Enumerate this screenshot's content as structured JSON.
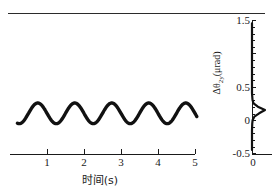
{
  "figure": {
    "has_top_rule": true,
    "background_color": "#ffffff",
    "line_color": "#1a1a1a"
  },
  "chart_data": [
    {
      "type": "line",
      "title": "",
      "subtitle": "",
      "xlabel": "时间(s)",
      "ylabel": "",
      "xlim": [
        0.2,
        5.1
      ],
      "ylim": [
        -0.5,
        1.5
      ],
      "xticks": [
        1,
        2,
        3,
        4,
        5
      ],
      "xticklabels": [
        "1",
        "2",
        "3",
        "4",
        "5"
      ],
      "grid": false,
      "legend": "none",
      "series": [
        {
          "name": "Δθ 2y oscillation",
          "waveform": "sine",
          "frequency_hz": 1.0,
          "amplitude": 0.155,
          "offset": 0.1,
          "phase_deg": 180,
          "x_start": 0.2,
          "x_end": 5.05,
          "color": "#111111",
          "linewidth": 3.0,
          "x": [
            0.2,
            0.3,
            0.4,
            0.5,
            0.6,
            0.7,
            0.8,
            0.9,
            1.0,
            1.1,
            1.2,
            1.3,
            1.4,
            1.5,
            1.6,
            1.7,
            1.8,
            1.9,
            2.0,
            2.1,
            2.2,
            2.3,
            2.4,
            2.5,
            2.6,
            2.7,
            2.8,
            2.9,
            3.0,
            3.1,
            3.2,
            3.3,
            3.4,
            3.5,
            3.6,
            3.7,
            3.8,
            3.9,
            4.0,
            4.1,
            4.2,
            4.3,
            4.4,
            4.5,
            4.6,
            4.7,
            4.8,
            4.9,
            5.0
          ],
          "y": [
            0.191,
            0.126,
            0.048,
            -0.006,
            -0.026,
            -0.006,
            0.048,
            0.126,
            0.21,
            0.28,
            0.252,
            0.198,
            0.048,
            -0.006,
            -0.026,
            -0.006,
            0.048,
            0.126,
            0.21,
            0.28,
            0.252,
            0.198,
            0.048,
            -0.006,
            -0.026,
            -0.006,
            0.048,
            0.126,
            0.21,
            0.28,
            0.252,
            0.198,
            0.048,
            -0.006,
            -0.026,
            -0.006,
            0.048,
            0.126,
            0.21,
            0.28,
            0.252,
            0.198,
            0.048,
            -0.006,
            -0.026,
            -0.006,
            0.048,
            0.126,
            0.21
          ]
        }
      ]
    },
    {
      "type": "line",
      "title": "",
      "xlabel": "0",
      "ylabel": "Δθ",
      "ylabel_sub": "2y",
      "ylabel_unit": "(μrad)",
      "ylabel_full": "Δθ₂ᵧ(μrad)",
      "ylim": [
        -0.5,
        1.5
      ],
      "yticks": [
        -0.5,
        0,
        0.5,
        1.0,
        1.5
      ],
      "yticklabels": [
        "-0.5",
        "0",
        "0.5",
        "",
        "1.5"
      ],
      "grid": false,
      "legend": "none",
      "description": "marginal distribution of Δθ 2y, narrow peak near 0.15 μrad",
      "series": [
        {
          "name": "distribution",
          "color": "#111111",
          "linewidth": 2.0,
          "peak_y": 0.15,
          "peak_x": 1.0,
          "y": [
            -0.45,
            -0.35,
            -0.25,
            -0.15,
            -0.05,
            0.0,
            0.05,
            0.1,
            0.15,
            0.2,
            0.25,
            0.3,
            0.4,
            0.5,
            0.7,
            0.9,
            1.1,
            1.3,
            1.45
          ],
          "x": [
            0.0,
            0.0,
            0.0,
            0.0,
            0.02,
            0.05,
            0.18,
            0.55,
            1.0,
            0.45,
            0.12,
            0.04,
            0.0,
            0.0,
            0.0,
            0.0,
            0.0,
            0.0,
            0.0
          ]
        }
      ]
    }
  ],
  "left_axis": {
    "ticklabels": [
      "1",
      "2",
      "3",
      "4",
      "5"
    ],
    "title": "时间(s)"
  },
  "right_axis": {
    "ticklabels": {
      "t1_5": "1.5",
      "t0_5": "0.5",
      "t0": "0",
      "tm0_5": "-0.5"
    },
    "title_main": "Δθ",
    "title_sub": "2y",
    "title_unit": "(μrad)",
    "xticklabel_zero": "0"
  }
}
